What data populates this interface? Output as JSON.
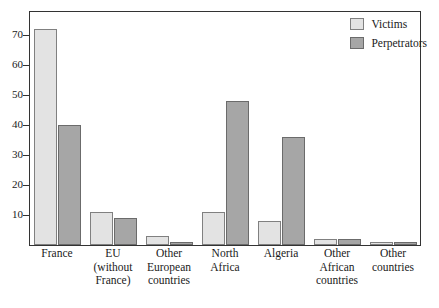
{
  "chart_data": {
    "type": "bar",
    "title": "",
    "subtitle": "",
    "xlabel": "",
    "ylabel": "",
    "ylim": [
      0,
      78
    ],
    "yticks": [
      10,
      20,
      30,
      40,
      50,
      60,
      70
    ],
    "ytick_labels": [
      "10",
      "20",
      "30",
      "40",
      "50",
      "60",
      "70"
    ],
    "grid": false,
    "legend_position": "top-right",
    "categories": [
      "France",
      "EU (without France)",
      "Other European countries",
      "North Africa",
      "Algeria",
      "Other African countries",
      "Other countries"
    ],
    "category_lines": [
      [
        "France"
      ],
      [
        "EU",
        "(without",
        "France)"
      ],
      [
        "Other",
        "European",
        "countries"
      ],
      [
        "North",
        "Africa"
      ],
      [
        "Algeria"
      ],
      [
        "Other",
        "African",
        "countries"
      ],
      [
        "Other",
        "countries"
      ]
    ],
    "series": [
      {
        "name": "Victims",
        "color": "#e3e3e3",
        "values": [
          72,
          11,
          3,
          11,
          8,
          2,
          1
        ]
      },
      {
        "name": "Perpetrators",
        "color": "#a6a6a6",
        "values": [
          40,
          9,
          1,
          48,
          36,
          2,
          1
        ]
      }
    ]
  },
  "legend": {
    "items": [
      {
        "label": "Victims",
        "swatch": "victims"
      },
      {
        "label": "Perpetrators",
        "swatch": "perpetrators"
      }
    ]
  },
  "colors": {
    "victims_fill": "#e3e3e3",
    "perpetrators_fill": "#a6a6a6",
    "axis": "#333333",
    "background": "#ffffff"
  }
}
